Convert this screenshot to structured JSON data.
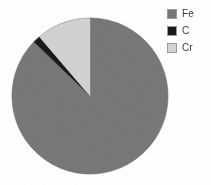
{
  "figure": {
    "background_color": "#ffffff",
    "legend_position": "right-top",
    "legend_text_color": "#3a3a3a"
  },
  "legend": {
    "items": [
      {
        "label": "Fe",
        "color": "#787878",
        "swatch_name": "legend-swatch-fe"
      },
      {
        "label": "C",
        "color": "#1a1a1a",
        "swatch_name": "legend-swatch-c"
      },
      {
        "label": "Cr",
        "color": "#d2d2d2",
        "swatch_name": "legend-swatch-cr"
      }
    ]
  },
  "chart_data": {
    "type": "pie",
    "title": "",
    "subtitle": "",
    "xlabel": "",
    "ylabel": "",
    "grid": false,
    "legend_position": "right-top",
    "start_angle_deg": 90,
    "direction": "counterclockwise",
    "categories": [
      "Fe",
      "C",
      "Cr"
    ],
    "values": [
      87.5,
      1.5,
      11.0
    ],
    "units": "percent",
    "colors": [
      "#787878",
      "#1a1a1a",
      "#d2d2d2"
    ],
    "slices": [
      {
        "label": "Fe",
        "value": 87.5,
        "color": "#787878",
        "start_angle_deg": 46.0,
        "end_angle_deg": 360.0,
        "sweep_deg": 314.0
      },
      {
        "label": "C",
        "value": 1.5,
        "color": "#1a1a1a",
        "start_angle_deg": 40.5,
        "end_angle_deg": 46.0,
        "sweep_deg": 5.5
      },
      {
        "label": "Cr",
        "value": 11.0,
        "color": "#d2d2d2",
        "start_angle_deg": 0.0,
        "end_angle_deg": 40.5,
        "sweep_deg": 40.5
      }
    ],
    "geometry": {
      "center_x": 90,
      "center_y": 96,
      "radius": 78
    }
  }
}
